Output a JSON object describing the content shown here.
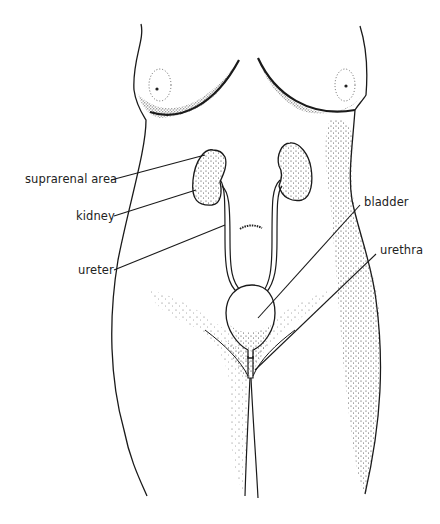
{
  "diagram": {
    "labels": {
      "suprarenal_area": "suprarenal area",
      "kidney": "kidney",
      "ureter": "ureter",
      "bladder": "bladder",
      "urethra": "urethra"
    },
    "colors": {
      "line": "#1a1a1a",
      "stipple": "#333333",
      "background": "#ffffff"
    }
  }
}
